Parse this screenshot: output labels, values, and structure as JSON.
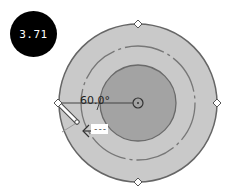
{
  "badge": {
    "value": "3.71"
  },
  "dial": {
    "angle_label": "60.0°",
    "tooltip_text": "---",
    "colors": {
      "outer_ring": "#c9c9c9",
      "inner_disc": "#a3a3a3",
      "stroke": "#666666",
      "badge_bg": "#000000",
      "badge_text": "#ffffff"
    },
    "handles": [
      "top",
      "right",
      "bottom",
      "left"
    ]
  }
}
